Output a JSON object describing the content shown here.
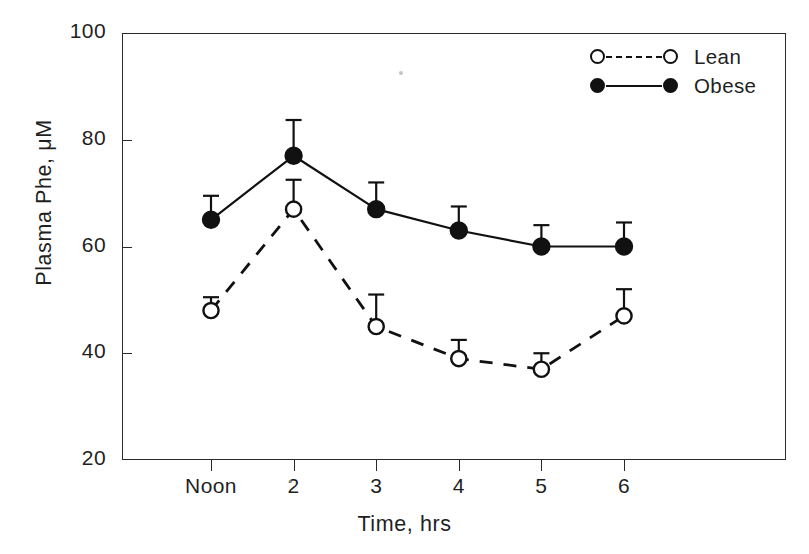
{
  "chart_data": {
    "type": "line",
    "title": "",
    "xlabel": "Time, hrs",
    "ylabel": "Plasma Phe, μM",
    "categories": [
      "Noon",
      "2",
      "3",
      "4",
      "5",
      "6"
    ],
    "ylim": [
      20,
      100
    ],
    "yticks": [
      20,
      40,
      60,
      80,
      100
    ],
    "ytick_labels": [
      "20",
      "40",
      "60",
      "80",
      "100"
    ],
    "grid": false,
    "legend_position": "top-right",
    "series": [
      {
        "name": "Lean",
        "marker": "open-circle",
        "linestyle": "dashed",
        "color": "#111111",
        "values": [
          48,
          67,
          45,
          39,
          37,
          47
        ],
        "errors": [
          2.5,
          5.5,
          6.0,
          3.5,
          3.0,
          5.0
        ]
      },
      {
        "name": "Obese",
        "marker": "filled-circle",
        "linestyle": "solid",
        "color": "#111111",
        "values": [
          65,
          77,
          67,
          63,
          60,
          60
        ],
        "errors": [
          4.5,
          6.7,
          5.0,
          4.5,
          4.0,
          4.5
        ]
      }
    ]
  },
  "axes": {
    "y_title": "Plasma Phe, μM",
    "x_title": "Time, hrs"
  },
  "legend": {
    "items": [
      {
        "label": "Lean",
        "marker": "open-circle",
        "linestyle": "dashed"
      },
      {
        "label": "Obese",
        "marker": "filled-circle",
        "linestyle": "solid"
      }
    ]
  },
  "style": {
    "ink": "#1f1f1f",
    "axis": "#2a2a2a",
    "background": "#ffffff"
  }
}
